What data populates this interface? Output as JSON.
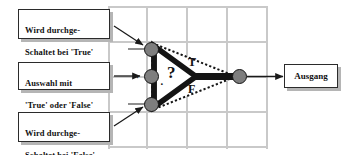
{
  "diagram": {
    "background_color": "#ffffff",
    "grid_color": "#c9c9c9",
    "node_fill": "#7e7e7e",
    "node_stroke": "#141414",
    "wire_color": "#1a1a1a",
    "box_border_color": "#2b2b2b",
    "box_shadow_color": "#b5b5b5"
  },
  "callouts": {
    "true_input": {
      "label": "Wird durchge-\nSchaltet bei 'True'",
      "line1": "Wird durchge-",
      "line2": "Schaltet bei 'True'"
    },
    "selector": {
      "label": "Auswahl mit\n'True' oder 'False'",
      "line1": "Auswahl mit",
      "line2": "'True' oder 'False'"
    },
    "false_input": {
      "label": "Wird durchge-\nSchaltet bei 'False'",
      "line1": "Wird durchge-",
      "line2": "Schaltet bei 'False'"
    }
  },
  "output": {
    "label": "Ausgang"
  },
  "symbol": {
    "question_mark": "?",
    "true_branch": "T",
    "false_branch": "F",
    "dot_marker": "·",
    "terminal_marker": "·",
    "node_names": [
      "true-input-node",
      "selector-node",
      "false-input-node",
      "output-node"
    ]
  }
}
